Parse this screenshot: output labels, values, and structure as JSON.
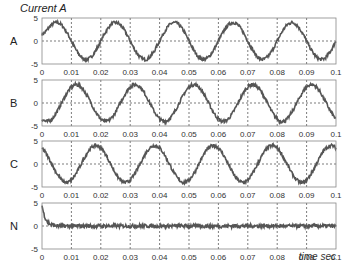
{
  "chart_data": {
    "type": "line",
    "title": "Current A",
    "xlabel": "time sec",
    "ylabel": "",
    "xlim": [
      0,
      0.1
    ],
    "ylim": [
      -5,
      5
    ],
    "grid": true,
    "x_ticks": [
      "0",
      "0.01",
      "0.02",
      "0.03",
      "0.04",
      "0.05",
      "0.06",
      "0.07",
      "0.08",
      "0.09",
      "0.1"
    ],
    "y_ticks": [
      "5",
      "0",
      "-5"
    ],
    "panels": [
      {
        "name": "A",
        "amplitude": 4,
        "frequency_hz": 50,
        "phase_deg": 0,
        "noise": 0.35,
        "initial_offset": 1.5
      },
      {
        "name": "B",
        "amplitude": 4,
        "frequency_hz": 50,
        "phase_deg": -120,
        "noise": 0.35,
        "initial_offset": 0
      },
      {
        "name": "C",
        "amplitude": 4,
        "frequency_hz": 50,
        "phase_deg": 120,
        "noise": 0.35,
        "initial_offset": 0
      },
      {
        "name": "N",
        "amplitude": 0,
        "frequency_hz": 50,
        "phase_deg": 0,
        "noise": 0.4,
        "initial_offset": 4.5
      }
    ]
  },
  "labels": {
    "title": "Current A",
    "xlabel": "time sec"
  },
  "colors": {
    "trace": "#555555",
    "grid": "#444444",
    "axis": "#888888",
    "text": "#333333"
  }
}
